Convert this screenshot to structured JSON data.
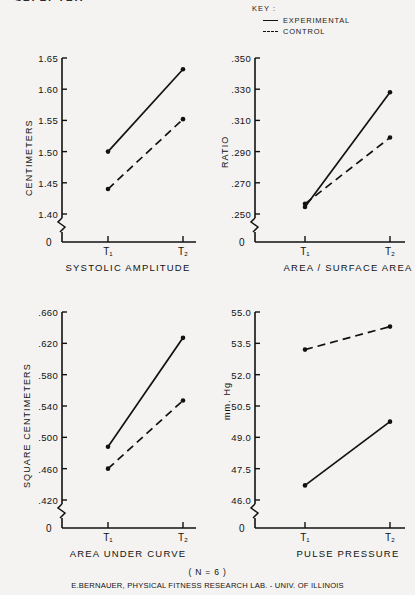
{
  "title_partial": "SELECTED",
  "key": {
    "heading": "KEY :",
    "items": [
      {
        "label": "EXPERIMENTAL",
        "style": "solid"
      },
      {
        "label": "CONTROL",
        "style": "dashed"
      }
    ]
  },
  "footer": {
    "sample_size": "( N = 6 )",
    "credit": "E.BERNAUER, PHYSICAL FITNESS RESEARCH LAB. - UNIV. OF ILLINOIS"
  },
  "x_categories": [
    "T₁",
    "T₂"
  ],
  "chart_data": [
    {
      "id": "systolic-amplitude",
      "type": "line",
      "title": "SYSTOLIC AMPLITUDE",
      "xlabel": "SYSTOLIC AMPLITUDE",
      "ylabel": "CENTIMETERS",
      "categories": [
        "T1",
        "T2"
      ],
      "ticklabels": [
        "1.40",
        "1.45",
        "1.50",
        "1.55",
        "1.60",
        "1.65"
      ],
      "tickvalues": [
        1.4,
        1.45,
        1.5,
        1.55,
        1.6,
        1.65
      ],
      "ylim": [
        1.4,
        1.65
      ],
      "axis_break": true,
      "origin_label": "0",
      "grid": false,
      "series": [
        {
          "name": "EXPERIMENTAL",
          "style": "solid",
          "values": [
            1.5,
            1.632
          ]
        },
        {
          "name": "CONTROL",
          "style": "dashed",
          "values": [
            1.44,
            1.552
          ]
        }
      ]
    },
    {
      "id": "area-surface-area",
      "type": "line",
      "title": "AREA / SURFACE AREA",
      "xlabel": "AREA / SURFACE AREA",
      "ylabel": "RATIO",
      "categories": [
        "T1",
        "T2"
      ],
      "ticklabels": [
        ".250",
        ".270",
        ".290",
        ".310",
        ".330",
        ".350"
      ],
      "tickvalues": [
        0.25,
        0.27,
        0.29,
        0.31,
        0.33,
        0.35
      ],
      "ylim": [
        0.25,
        0.35
      ],
      "axis_break": true,
      "origin_label": "0",
      "grid": false,
      "series": [
        {
          "name": "EXPERIMENTAL",
          "style": "solid",
          "values": [
            0.2545,
            0.328
          ]
        },
        {
          "name": "CONTROL",
          "style": "dashed",
          "values": [
            0.2565,
            0.299
          ]
        }
      ]
    },
    {
      "id": "area-under-curve",
      "type": "line",
      "title": "AREA UNDER CURVE",
      "xlabel": "AREA UNDER CURVE",
      "ylabel": "SQUARE CENTIMETERS",
      "categories": [
        "T1",
        "T2"
      ],
      "ticklabels": [
        ".420",
        ".460",
        ".500",
        ".540",
        ".580",
        ".620",
        ".660"
      ],
      "tickvalues": [
        0.42,
        0.46,
        0.5,
        0.54,
        0.58,
        0.62,
        0.66
      ],
      "ylim": [
        0.42,
        0.66
      ],
      "axis_break": true,
      "origin_label": "0",
      "grid": false,
      "series": [
        {
          "name": "EXPERIMENTAL",
          "style": "solid",
          "values": [
            0.488,
            0.627
          ]
        },
        {
          "name": "CONTROL",
          "style": "dashed",
          "values": [
            0.46,
            0.547
          ]
        }
      ]
    },
    {
      "id": "pulse-pressure",
      "type": "line",
      "title": "PULSE PRESSURE",
      "xlabel": "PULSE PRESSURE",
      "ylabel": "mm. Hg",
      "categories": [
        "T1",
        "T2"
      ],
      "ticklabels": [
        "46.0",
        "47.5",
        "49.0",
        "50.5",
        "52.0",
        "53.5",
        "55.0"
      ],
      "tickvalues": [
        46.0,
        47.5,
        49.0,
        50.5,
        52.0,
        53.5,
        55.0
      ],
      "ylim": [
        46.0,
        55.0
      ],
      "axis_break": true,
      "origin_label": "0",
      "grid": false,
      "series": [
        {
          "name": "EXPERIMENTAL",
          "style": "solid",
          "values": [
            46.7,
            49.75
          ]
        },
        {
          "name": "CONTROL",
          "style": "dashed",
          "values": [
            53.2,
            54.3
          ]
        }
      ]
    }
  ]
}
